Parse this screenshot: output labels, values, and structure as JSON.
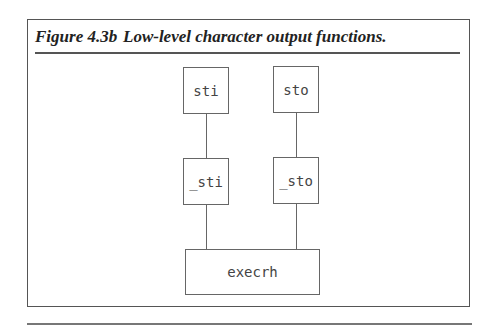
{
  "figure": {
    "number": "Figure 4.3b",
    "title": "Low-level character output functions."
  },
  "diagram": {
    "nodes": {
      "sti": "sti",
      "sto": "sto",
      "_sti": "_sti",
      "_sto": "_sto",
      "execrh": "execrh"
    },
    "edges": [
      [
        "sti",
        "_sti"
      ],
      [
        "sto",
        "_sto"
      ],
      [
        "_sti",
        "execrh"
      ],
      [
        "_sto",
        "execrh"
      ]
    ]
  }
}
